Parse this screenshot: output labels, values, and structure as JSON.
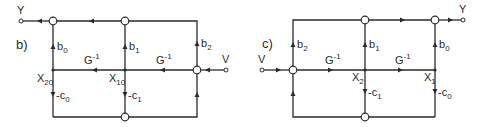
{
  "diagrams": [
    {
      "panel_label": "b)",
      "input_label": "V",
      "output_label": "Y",
      "gains": {
        "top_feedforward": [
          "b0",
          "b1",
          "b2"
        ],
        "integrator_1": "G",
        "integrator_2": "G",
        "integrator_exp": "-1",
        "feedback": [
          "-c0",
          "-c1"
        ]
      },
      "labels": {
        "b0": "b",
        "b0_sub": "0",
        "b1": "b",
        "b1_sub": "1",
        "b2": "b",
        "b2_sub": "2",
        "g1": "G",
        "g1_sup": "-1",
        "g2": "G",
        "g2_sup": "-1",
        "c0": "-c",
        "c0_sub": "0",
        "c1": "-c",
        "c1_sub": "1",
        "x20": "X",
        "x20_sub": "20",
        "x10": "X",
        "x10_sub": "10"
      }
    },
    {
      "panel_label": "c)",
      "input_label": "V",
      "output_label": "Y",
      "labels": {
        "b2": "b",
        "b2_sub": "2",
        "b1": "b",
        "b1_sub": "1",
        "b0": "b",
        "b0_sub": "0",
        "g1": "G",
        "g1_sup": "-1",
        "g2": "G",
        "g2_sup": "-1",
        "c1": "-c",
        "c1_sub": "1",
        "c0": "-c",
        "c0_sub": "0",
        "x2": "X",
        "x2_sub": "2",
        "x1": "X",
        "x1_sub": "1"
      }
    }
  ]
}
